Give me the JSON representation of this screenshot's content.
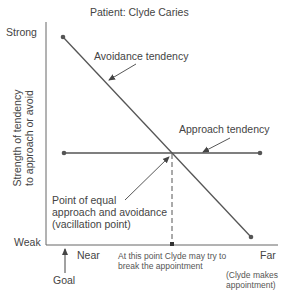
{
  "title": "Patient: Clyde Caries",
  "y_axis": {
    "label_line1": "Strength of tendency",
    "label_line2": "to approach or avoid",
    "top_label": "Strong",
    "bottom_label": "Weak"
  },
  "x_axis": {
    "near_label": "Near",
    "far_label": "Far",
    "goal_label": "Goal",
    "far_note_line1": "(Clyde makes",
    "far_note_line2": "appointment)"
  },
  "lines": {
    "avoidance_label": "Avoidance tendency",
    "approach_label": "Approach tendency"
  },
  "annotations": {
    "equal_point_line1": "Point of equal",
    "equal_point_line2": "approach and avoidance",
    "equal_point_line3": "(vacillation point)",
    "break_line1": "At this point Clyde may try to",
    "break_line2": "break the appointment"
  },
  "colors": {
    "line": "#555555",
    "text": "#444444",
    "background": "#ffffff"
  }
}
